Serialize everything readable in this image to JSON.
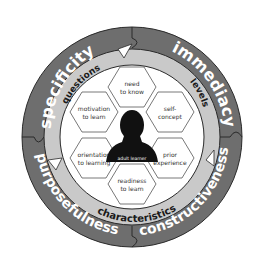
{
  "outer_ring": {
    "labels": [
      "specificity",
      "immediacy",
      "purposefulness",
      "constructiveness"
    ],
    "color": "#6e6e6e",
    "text_color": "#ffffff"
  },
  "middle_ring": {
    "labels": [
      "questions",
      "levels",
      "characteristics"
    ],
    "color": "#c9c9c9",
    "text_color": "#1a1a1a"
  },
  "hexagons": [
    {
      "line1": "need",
      "line2": "to know"
    },
    {
      "line1": "self-",
      "line2": "concept"
    },
    {
      "line1": "prior",
      "line2": "experience"
    },
    {
      "line1": "readiness",
      "line2": "to learn"
    },
    {
      "line1": "orientation",
      "line2": "to learning"
    },
    {
      "line1": "motivation",
      "line2": "to learn"
    }
  ],
  "center": {
    "label": "adult learner"
  }
}
